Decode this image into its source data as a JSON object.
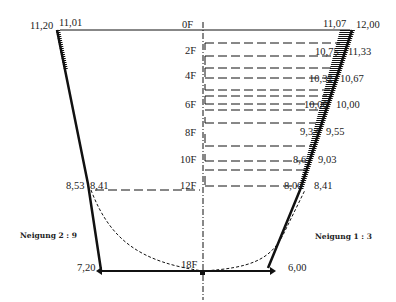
{
  "diagram": {
    "depth_levels": [
      {
        "label": "0F",
        "y": 30
      },
      {
        "label": "2F",
        "y": 50
      },
      {
        "label": "4F",
        "y": 71
      },
      {
        "label": "6F",
        "y": 91
      },
      {
        "label": "8F",
        "y": 110
      },
      {
        "label": "10F",
        "y": 131
      },
      {
        "label": "12F",
        "y": 162
      },
      {
        "label": "18F",
        "y": 270
      }
    ],
    "left_labels": {
      "top_outer": "11,20",
      "top_inner": "11,01",
      "mid_outer": "8,53",
      "mid_inner": "8,41",
      "bottom": "7,20"
    },
    "right_labels": {
      "inner": [
        "11,07",
        "10,75",
        "10,32",
        "10,00",
        "9,33",
        "8,67",
        "8,00"
      ],
      "outer": [
        "12,00",
        "11,33",
        "10,67",
        "10,00",
        "9,55",
        "9,03",
        "8,41"
      ],
      "bottom": "6,00"
    },
    "slopes": {
      "left": "Neigung 2 : 9",
      "right": "Neigung 1 : 3"
    },
    "colors": {
      "line": "#111111",
      "background": "#ffffff"
    }
  }
}
